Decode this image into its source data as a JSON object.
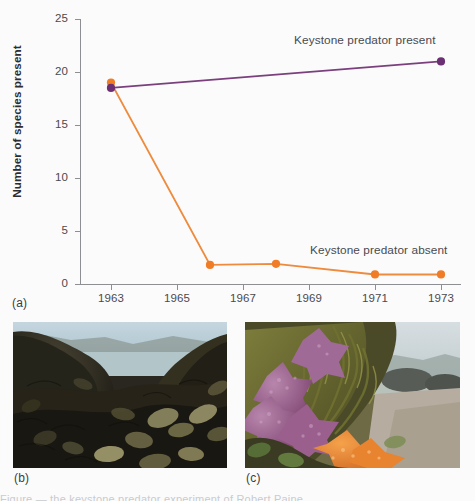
{
  "figure": {
    "captions": {
      "a": "(a)",
      "b": "(b)",
      "c": "(c)"
    },
    "bottom_cut_text": "Figure — the keystone predator experiment of Robert Paine"
  },
  "chart_data": {
    "type": "line",
    "title": "",
    "xlabel": "",
    "ylabel": "Number of species present",
    "xlim": [
      1962,
      1973.6
    ],
    "ylim": [
      0,
      25
    ],
    "grid": false,
    "legend_position": "inline-annotation",
    "x_ticks": [
      "1963",
      "1965",
      "1967",
      "1969",
      "1971",
      "1973"
    ],
    "x_tick_values": [
      1963,
      1965,
      1967,
      1969,
      1971,
      1973
    ],
    "y_ticks": [
      "0",
      "5",
      "10",
      "15",
      "20",
      "25"
    ],
    "y_tick_values": [
      0,
      5,
      10,
      15,
      20,
      25
    ],
    "series": [
      {
        "name": "Keystone predator present",
        "color": "#7b3f7e",
        "marker_color": "#6b2f73",
        "x": [
          1963,
          1973
        ],
        "values": [
          18.5,
          21.0
        ]
      },
      {
        "name": "Keystone predator absent",
        "color": "#ee8b3c",
        "marker_color": "#f07c26",
        "x": [
          1963,
          1966,
          1968,
          1971,
          1973
        ],
        "values": [
          19.0,
          1.8,
          1.9,
          0.9,
          0.9
        ]
      }
    ],
    "annotations": [
      {
        "text": "Keystone predator present",
        "x": 1969.5,
        "y": 23.0
      },
      {
        "text": "Keystone predator absent",
        "x": 1970.0,
        "y": 4.1
      }
    ]
  },
  "photos": {
    "b": {
      "alt_name": "mussel-bed-photo",
      "description": "Dense dark mussel bed covering intertidal rocks with shoreline and sky behind"
    },
    "c": {
      "alt_name": "sea-star-photo",
      "description": "Purple and orange sea stars on algae-covered intertidal rock with bay behind"
    }
  },
  "colors": {
    "purple": "#7b3f7e",
    "orange": "#ee8b3c",
    "axis": "#8d8f93",
    "text": "#4a4a4d"
  }
}
